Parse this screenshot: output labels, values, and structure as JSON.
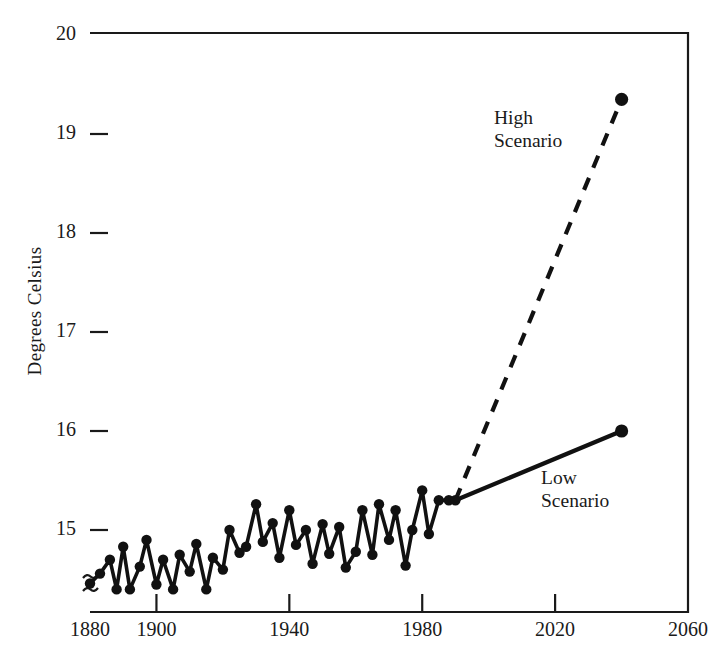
{
  "axes": {
    "ylabel": "Degrees Celsius",
    "yticks": [
      "20",
      "19",
      "18",
      "17",
      "16",
      "15"
    ],
    "xticks": [
      "1880",
      "1900",
      "1940",
      "1980",
      "2020",
      "2060"
    ],
    "axis_break_symbol": "~"
  },
  "annotations": {
    "high": "High\nScenario",
    "low": "Low\nScenario"
  },
  "chart_data": {
    "type": "line",
    "title": "",
    "xlabel": "",
    "ylabel": "Degrees Celsius",
    "xlim": [
      1880,
      2060
    ],
    "ylim": [
      14.2,
      20
    ],
    "y_axis_break_below": 15,
    "grid": false,
    "legend": "none (inline annotations)",
    "xticks": [
      1880,
      1900,
      1940,
      1980,
      2020,
      2060
    ],
    "yticks": [
      15,
      16,
      17,
      18,
      19,
      20
    ],
    "series": [
      {
        "name": "Observed",
        "style": "solid",
        "markers": true,
        "x": [
          1880,
          1883,
          1886,
          1888,
          1890,
          1892,
          1895,
          1897,
          1900,
          1902,
          1905,
          1907,
          1910,
          1912,
          1915,
          1917,
          1920,
          1922,
          1925,
          1927,
          1930,
          1932,
          1935,
          1937,
          1940,
          1942,
          1945,
          1947,
          1950,
          1952,
          1955,
          1957,
          1960,
          1962,
          1965,
          1967,
          1970,
          1972,
          1975,
          1977,
          1980,
          1982,
          1985,
          1988,
          1990
        ],
        "y": [
          14.46,
          14.56,
          14.7,
          14.4,
          14.83,
          14.4,
          14.63,
          14.9,
          14.45,
          14.7,
          14.4,
          14.75,
          14.58,
          14.86,
          14.4,
          14.72,
          14.6,
          15.0,
          14.77,
          14.83,
          15.26,
          14.88,
          15.07,
          14.72,
          15.2,
          14.85,
          15.0,
          14.66,
          15.06,
          14.76,
          15.03,
          14.62,
          14.78,
          15.2,
          14.75,
          15.26,
          14.9,
          15.2,
          14.64,
          15.0,
          15.4,
          14.96,
          15.3,
          15.3,
          15.3
        ]
      },
      {
        "name": "High Scenario",
        "style": "dashed",
        "markers": "endpoint-only",
        "x": [
          1990,
          2040
        ],
        "y": [
          15.3,
          19.35
        ]
      },
      {
        "name": "Low Scenario",
        "style": "solid",
        "markers": "endpoint-only",
        "x": [
          1990,
          2040
        ],
        "y": [
          15.3,
          16.0
        ]
      }
    ]
  }
}
